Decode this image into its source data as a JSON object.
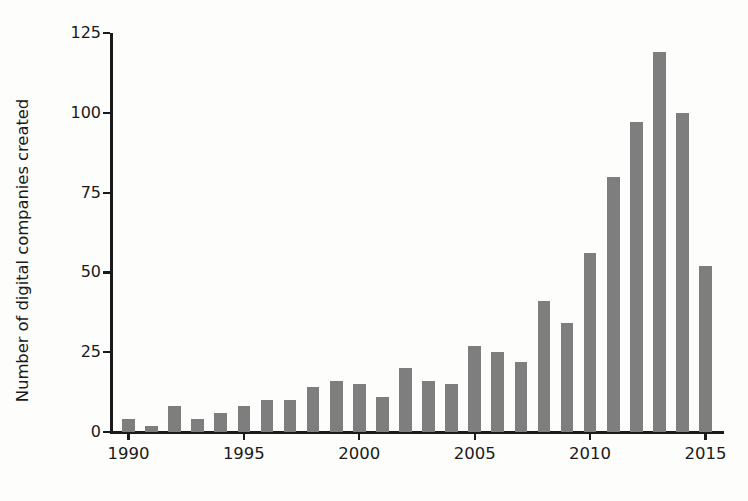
{
  "chart_data": {
    "type": "bar",
    "title": "",
    "xlabel": "",
    "ylabel": "Number of digital companies created",
    "categories": [
      1990,
      1991,
      1992,
      1993,
      1994,
      1995,
      1996,
      1997,
      1998,
      1999,
      2000,
      2001,
      2002,
      2003,
      2004,
      2005,
      2006,
      2007,
      2008,
      2009,
      2010,
      2011,
      2012,
      2013,
      2014,
      2015
    ],
    "values": [
      4,
      2,
      8,
      4,
      6,
      8,
      10,
      10,
      14,
      16,
      15,
      11,
      20,
      16,
      15,
      27,
      25,
      22,
      41,
      34,
      56,
      80,
      97,
      119,
      100,
      52
    ],
    "xlim": [
      1989.2,
      2015.8
    ],
    "ylim": [
      0,
      125
    ],
    "xticks": [
      1990,
      1995,
      2000,
      2005,
      2010,
      2015
    ],
    "xticklabels": [
      "1990",
      "1995",
      "2000",
      "2005",
      "2010",
      "2015"
    ],
    "yticks": [
      0,
      25,
      50,
      75,
      100,
      125
    ],
    "yticklabels": [
      "0",
      "25",
      "50",
      "75",
      "100",
      "125"
    ],
    "grid": false,
    "legend": null,
    "bar_color": "#7e7e7e",
    "axis_color": "#1a1a1a",
    "background_color": "#fdfdfc"
  }
}
